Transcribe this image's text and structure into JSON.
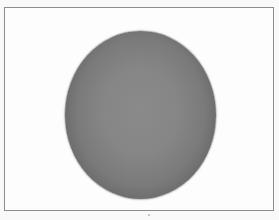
{
  "image": {
    "subject": "grey shaded sphere",
    "background_color": "#fdfdfd",
    "frame_color": "#8c8c8c",
    "sphere_center_color": "#8a8a8a",
    "sphere_edge_color": "#3e3e3e"
  }
}
